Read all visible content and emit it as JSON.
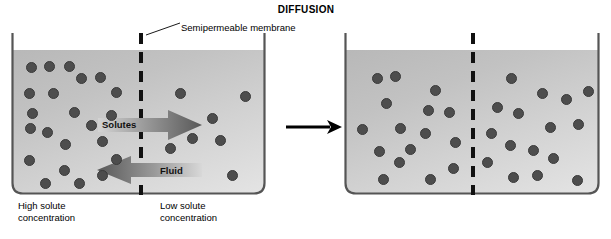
{
  "figure": {
    "title": "DIFFUSION",
    "callout": {
      "label": "Semipermeable membrane"
    }
  },
  "colors": {
    "fluid_light": "#e4e4e4",
    "fluid_dark": "#b8b8b8",
    "particle": "#4d4d4d",
    "membrane": "#111111",
    "arrow_dark": "#5c5c5c",
    "arrow_light": "#cfcfcf",
    "text": "#000000",
    "wall": "#555555"
  },
  "flows": [
    {
      "name": "solutes",
      "label": "Solutes",
      "direction": "right"
    },
    {
      "name": "fluid",
      "label": "Fluid",
      "direction": "left"
    }
  ],
  "transition": {
    "name": "time-progression-arrow",
    "direction": "right"
  },
  "panels": [
    {
      "id": "before",
      "name": "before-diffusion",
      "captions": [
        {
          "name": "high-solute-caption",
          "lines": [
            "High solute",
            "concentration"
          ],
          "x": 18,
          "y": 200
        },
        {
          "name": "low-solute-caption",
          "lines": [
            "Low solute",
            "concentration"
          ],
          "x": 160,
          "y": 200
        }
      ],
      "particles_left": [
        [
          26,
          62
        ],
        [
          44,
          61
        ],
        [
          64,
          61
        ],
        [
          76,
          73
        ],
        [
          95,
          72
        ],
        [
          24,
          88
        ],
        [
          48,
          88
        ],
        [
          111,
          87
        ],
        [
          27,
          108
        ],
        [
          69,
          107
        ],
        [
          106,
          110
        ],
        [
          25,
          123
        ],
        [
          42,
          127
        ],
        [
          86,
          120
        ],
        [
          60,
          139
        ],
        [
          97,
          136
        ],
        [
          24,
          155
        ],
        [
          111,
          154
        ],
        [
          59,
          165
        ],
        [
          97,
          170
        ],
        [
          40,
          178
        ],
        [
          74,
          178
        ]
      ],
      "particles_right": [
        [
          175,
          88
        ],
        [
          240,
          91
        ],
        [
          207,
          113
        ],
        [
          187,
          133
        ],
        [
          215,
          135
        ],
        [
          165,
          143
        ],
        [
          227,
          170
        ]
      ]
    },
    {
      "id": "after",
      "name": "after-diffusion",
      "particles_left": [
        [
          372,
          73
        ],
        [
          390,
          71
        ],
        [
          430,
          85
        ],
        [
          381,
          98
        ],
        [
          423,
          105
        ],
        [
          444,
          107
        ],
        [
          357,
          124
        ],
        [
          395,
          123
        ],
        [
          420,
          128
        ],
        [
          450,
          137
        ],
        [
          374,
          146
        ],
        [
          405,
          144
        ],
        [
          394,
          157
        ],
        [
          448,
          163
        ],
        [
          378,
          174
        ],
        [
          425,
          174
        ]
      ],
      "particles_right": [
        [
          506,
          73
        ],
        [
          537,
          88
        ],
        [
          561,
          94
        ],
        [
          583,
          86
        ],
        [
          492,
          102
        ],
        [
          513,
          108
        ],
        [
          545,
          122
        ],
        [
          573,
          119
        ],
        [
          486,
          128
        ],
        [
          505,
          140
        ],
        [
          528,
          145
        ],
        [
          548,
          153
        ],
        [
          482,
          157
        ],
        [
          508,
          172
        ],
        [
          532,
          170
        ],
        [
          572,
          175
        ]
      ]
    }
  ],
  "geometry": {
    "beaker_before": {
      "x": 11,
      "y": 33,
      "w": 255,
      "h": 162
    },
    "beaker_after": {
      "x": 344,
      "y": 33,
      "w": 256,
      "h": 162
    },
    "membrane_before": {
      "x": 139,
      "y": 33,
      "h": 162
    },
    "membrane_after": {
      "x": 471,
      "y": 33,
      "h": 162
    }
  }
}
